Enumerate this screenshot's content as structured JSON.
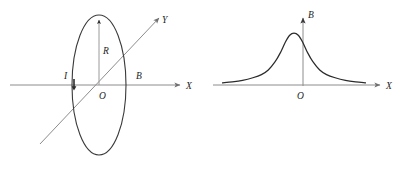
{
  "figure": {
    "background_color": "#ffffff",
    "line_color": "#2b2b2b",
    "axis_color": "#8c8c8c"
  },
  "chart_data": [
    {
      "id": "left-panel",
      "type": "diagram",
      "title": "Circular current loop in perspective view",
      "xlabel": "X",
      "ylabel": "Y",
      "grid": false,
      "legend": null,
      "annotations": [
        {
          "name": "current-label",
          "text": "I",
          "x": 70,
          "y": 76,
          "meaning": "current direction in loop"
        },
        {
          "name": "radius-label",
          "text": "R",
          "x": 105,
          "y": 51,
          "meaning": "loop radius"
        },
        {
          "name": "field-label",
          "text": "B",
          "x": 139,
          "y": 75,
          "meaning": "magnetic field along X axis"
        },
        {
          "name": "origin-label",
          "text": "O",
          "x": 103,
          "y": 97,
          "meaning": "origin / loop centre"
        },
        {
          "name": "x-axis-label",
          "text": "X",
          "x": 189,
          "y": 90,
          "meaning": "X axis"
        },
        {
          "name": "y-axis-label",
          "text": "Y",
          "x": 166,
          "y": 22,
          "meaning": "Y axis"
        }
      ],
      "shapes": [
        {
          "name": "current-loop-ellipse",
          "type": "ellipse",
          "cx": 99,
          "cy": 85,
          "rx": 27,
          "ry": 70
        },
        {
          "name": "x-axis",
          "type": "arrow",
          "x1": 10,
          "y1": 85,
          "x2": 182,
          "y2": 85
        },
        {
          "name": "y-axis",
          "type": "arrow",
          "x1": 40,
          "y1": 143,
          "x2": 160,
          "y2": 17
        },
        {
          "name": "radius-arrow",
          "type": "arrow",
          "x1": 99,
          "y1": 85,
          "x2": 99,
          "y2": 18
        }
      ]
    },
    {
      "id": "right-panel",
      "type": "line",
      "title": "Axial magnetic field magnitude versus position",
      "xlabel": "X",
      "ylabel": "B",
      "grid": false,
      "legend": null,
      "curve_shape": "bell",
      "peak_x": 0,
      "peak_value": 1.0,
      "xlim": [
        -4.2,
        4.2
      ],
      "ylim": [
        0,
        1.1
      ],
      "x": [
        -4.2,
        -3.6,
        -3.0,
        -2.4,
        -1.9,
        -1.5,
        -1.1,
        -0.8,
        -0.5,
        -0.25,
        0,
        0.25,
        0.5,
        0.8,
        1.1,
        1.5,
        1.9,
        2.4,
        3.0,
        3.6,
        4.2
      ],
      "values": [
        0.04,
        0.06,
        0.09,
        0.14,
        0.2,
        0.29,
        0.45,
        0.62,
        0.83,
        0.96,
        1.0,
        0.96,
        0.83,
        0.62,
        0.45,
        0.29,
        0.2,
        0.14,
        0.09,
        0.06,
        0.04
      ],
      "annotations": [
        {
          "name": "field-axis-label",
          "text": "B",
          "x": 312,
          "y": 14,
          "meaning": "magnetic field axis"
        },
        {
          "name": "origin-label",
          "text": "O",
          "x": 300,
          "y": 97,
          "meaning": "origin"
        },
        {
          "name": "x-axis-label",
          "text": "X",
          "x": 389,
          "y": 90,
          "meaning": "X axis"
        }
      ],
      "shapes": [
        {
          "name": "x-axis",
          "type": "arrow",
          "x1": 213,
          "y1": 85,
          "x2": 382,
          "y2": 85
        },
        {
          "name": "b-axis",
          "type": "arrow",
          "x1": 303,
          "y1": 85,
          "x2": 303,
          "y2": 16
        }
      ]
    }
  ],
  "labels": {
    "left": {
      "current": "I",
      "radius": "R",
      "field": "B",
      "origin": "O",
      "x_axis": "X",
      "y_axis": "Y"
    },
    "right": {
      "field_axis": "B",
      "origin": "O",
      "x_axis": "X"
    }
  }
}
